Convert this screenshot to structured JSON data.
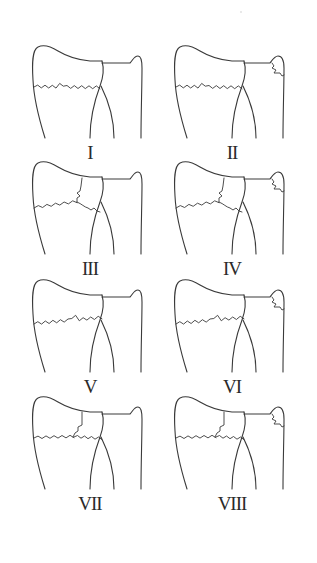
{
  "figure": {
    "line_color": "#3a3a3a",
    "background": "#ffffff",
    "panels": [
      {
        "label": "I",
        "radius_fracture": "extra-articular",
        "intra_articular": "none",
        "ulnar_styloid_fracture": false
      },
      {
        "label": "II",
        "radius_fracture": "extra-articular",
        "intra_articular": "none",
        "ulnar_styloid_fracture": true
      },
      {
        "label": "III",
        "radius_fracture": "intra-articular",
        "intra_articular": "radiocarpal",
        "ulnar_styloid_fracture": false
      },
      {
        "label": "IV",
        "radius_fracture": "intra-articular",
        "intra_articular": "radiocarpal",
        "ulnar_styloid_fracture": true
      },
      {
        "label": "V",
        "radius_fracture": "intra-articular",
        "intra_articular": "radioulnar",
        "ulnar_styloid_fracture": false
      },
      {
        "label": "VI",
        "radius_fracture": "intra-articular",
        "intra_articular": "radioulnar",
        "ulnar_styloid_fracture": true
      },
      {
        "label": "VII",
        "radius_fracture": "intra-articular",
        "intra_articular": "radiocarpal and radioulnar",
        "ulnar_styloid_fracture": false
      },
      {
        "label": "VIII",
        "radius_fracture": "intra-articular",
        "intra_articular": "radiocarpal and radioulnar",
        "ulnar_styloid_fracture": true
      }
    ]
  }
}
